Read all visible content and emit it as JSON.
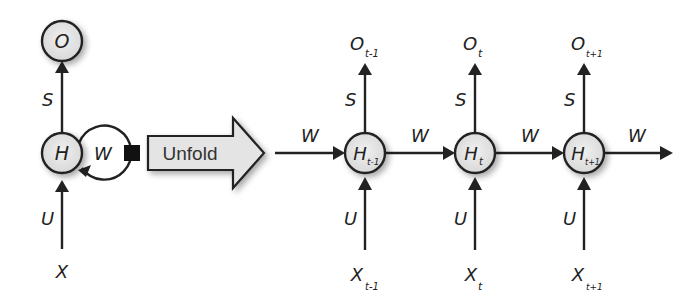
{
  "colors": {
    "stroke": "#222222",
    "node_fill": "#e6e6e6",
    "arrow_fill": "#e2e2e2",
    "background": "#ffffff"
  },
  "folded": {
    "output_node": "O",
    "hidden_node": "H",
    "input_label": "X",
    "output_weight": "S",
    "input_weight": "U",
    "recurrent_weight": "W"
  },
  "unfold_arrow": {
    "label": "Unfold"
  },
  "unfolded": {
    "incoming_weight": "W",
    "outgoing_weight": "W",
    "steps": [
      {
        "hidden": "H",
        "hidden_sub": "t-1",
        "output": "O",
        "output_sub": "t-1",
        "input": "X",
        "input_sub": "t-1",
        "s_label": "S",
        "u_label": "U",
        "w_after": "W"
      },
      {
        "hidden": "H",
        "hidden_sub": "t",
        "output": "O",
        "output_sub": "t",
        "input": "X",
        "input_sub": "t",
        "s_label": "S",
        "u_label": "U",
        "w_after": "W"
      },
      {
        "hidden": "H",
        "hidden_sub": "t+1",
        "output": "O",
        "output_sub": "t+1",
        "input": "X",
        "input_sub": "t+1",
        "s_label": "S",
        "u_label": "U",
        "w_after": "W"
      }
    ]
  }
}
